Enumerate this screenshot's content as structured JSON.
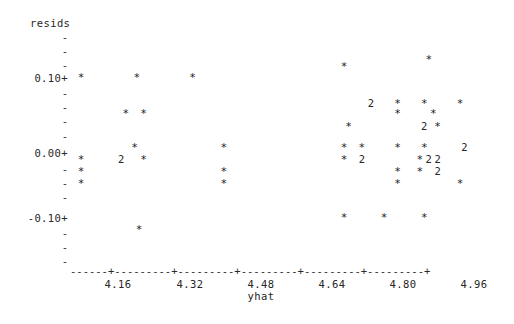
{
  "chart_data": {
    "type": "scatter",
    "title": "",
    "subtitle": "",
    "ylabel": "resids",
    "xlabel": "yhat",
    "style": "character-grid-ascii-scatter",
    "grid": false,
    "legend": null,
    "point_glyph": "*",
    "overlap_glyph_note": "digit shows number of overlapping points at that cell",
    "xlim": [
      4.08,
      5.0
    ],
    "ylim": [
      -0.155,
      0.155
    ],
    "x_ticks": [
      "4.16",
      "4.32",
      "4.48",
      "4.64",
      "4.80",
      "4.96"
    ],
    "x_tick_values": [
      4.16,
      4.32,
      4.48,
      4.64,
      4.8,
      4.96
    ],
    "y_ticks": [
      "0.10+",
      "0.00+",
      "-0.10+"
    ],
    "y_tick_values": [
      0.1,
      0.0,
      -0.1
    ],
    "y_minor_tick_glyph": "-",
    "axis_line": "------+---------+---------+---------+---------+---------+",
    "points": [
      {
        "x": 4.105,
        "y": 0.1,
        "glyph": "*",
        "count": 1
      },
      {
        "x": 4.23,
        "y": 0.1,
        "glyph": "*",
        "count": 1
      },
      {
        "x": 4.355,
        "y": 0.1,
        "glyph": "*",
        "count": 1
      },
      {
        "x": 4.695,
        "y": 0.115,
        "glyph": "*",
        "count": 1
      },
      {
        "x": 4.885,
        "y": 0.125,
        "glyph": "*",
        "count": 1
      },
      {
        "x": 4.755,
        "y": 0.062,
        "glyph": "2",
        "count": 2
      },
      {
        "x": 4.815,
        "y": 0.062,
        "glyph": "*",
        "count": 1
      },
      {
        "x": 4.875,
        "y": 0.062,
        "glyph": "*",
        "count": 1
      },
      {
        "x": 4.955,
        "y": 0.062,
        "glyph": "*",
        "count": 1
      },
      {
        "x": 4.205,
        "y": 0.048,
        "glyph": "*",
        "count": 1
      },
      {
        "x": 4.245,
        "y": 0.048,
        "glyph": "*",
        "count": 1
      },
      {
        "x": 4.815,
        "y": 0.048,
        "glyph": "*",
        "count": 1
      },
      {
        "x": 4.895,
        "y": 0.048,
        "glyph": "*",
        "count": 1
      },
      {
        "x": 4.705,
        "y": 0.03,
        "glyph": "*",
        "count": 1
      },
      {
        "x": 4.875,
        "y": 0.03,
        "glyph": "2",
        "count": 2
      },
      {
        "x": 4.905,
        "y": 0.03,
        "glyph": "*",
        "count": 1
      },
      {
        "x": 4.225,
        "y": 0.0,
        "glyph": "*",
        "count": 1
      },
      {
        "x": 4.425,
        "y": 0.0,
        "glyph": "*",
        "count": 1
      },
      {
        "x": 4.695,
        "y": 0.0,
        "glyph": "*",
        "count": 1
      },
      {
        "x": 4.735,
        "y": 0.0,
        "glyph": "*",
        "count": 1
      },
      {
        "x": 4.815,
        "y": 0.0,
        "glyph": "*",
        "count": 1
      },
      {
        "x": 4.875,
        "y": 0.0,
        "glyph": "*",
        "count": 1
      },
      {
        "x": 4.965,
        "y": 0.0,
        "glyph": "2",
        "count": 2
      },
      {
        "x": 4.105,
        "y": -0.018,
        "glyph": "*",
        "count": 1
      },
      {
        "x": 4.195,
        "y": -0.018,
        "glyph": "2",
        "count": 2
      },
      {
        "x": 4.245,
        "y": -0.018,
        "glyph": "*",
        "count": 1
      },
      {
        "x": 4.695,
        "y": -0.018,
        "glyph": "*",
        "count": 1
      },
      {
        "x": 4.735,
        "y": -0.018,
        "glyph": "2",
        "count": 2
      },
      {
        "x": 4.865,
        "y": -0.018,
        "glyph": "*",
        "count": 1
      },
      {
        "x": 4.885,
        "y": -0.018,
        "glyph": "2",
        "count": 2
      },
      {
        "x": 4.905,
        "y": -0.018,
        "glyph": "2",
        "count": 2
      },
      {
        "x": 4.105,
        "y": -0.035,
        "glyph": "*",
        "count": 1
      },
      {
        "x": 4.425,
        "y": -0.035,
        "glyph": "*",
        "count": 1
      },
      {
        "x": 4.815,
        "y": -0.035,
        "glyph": "*",
        "count": 1
      },
      {
        "x": 4.865,
        "y": -0.035,
        "glyph": "*",
        "count": 1
      },
      {
        "x": 4.905,
        "y": -0.035,
        "glyph": "2",
        "count": 2
      },
      {
        "x": 4.105,
        "y": -0.052,
        "glyph": "*",
        "count": 1
      },
      {
        "x": 4.425,
        "y": -0.052,
        "glyph": "*",
        "count": 1
      },
      {
        "x": 4.815,
        "y": -0.052,
        "glyph": "*",
        "count": 1
      },
      {
        "x": 4.955,
        "y": -0.052,
        "glyph": "*",
        "count": 1
      },
      {
        "x": 4.695,
        "y": -0.1,
        "glyph": "*",
        "count": 1
      },
      {
        "x": 4.785,
        "y": -0.1,
        "glyph": "*",
        "count": 1
      },
      {
        "x": 4.875,
        "y": -0.1,
        "glyph": "*",
        "count": 1
      },
      {
        "x": 4.235,
        "y": -0.118,
        "glyph": "*",
        "count": 1
      }
    ]
  },
  "layout": {
    "plot_left_px": 70,
    "plot_right_px": 480,
    "axis_y_px": 271,
    "row_height_px": 14.2,
    "x_per_px": 0.0022535,
    "tick_px": [
      118,
      190,
      261,
      332,
      403,
      474
    ]
  },
  "rows": {
    "y_axis_rows": [
      {
        "label": "",
        "glyph": "-",
        "major": false,
        "top": 32
      },
      {
        "label": "",
        "glyph": "-",
        "major": false,
        "top": 46
      },
      {
        "label": "",
        "glyph": "-",
        "major": false,
        "top": 60
      },
      {
        "label": "0.10+",
        "glyph": "",
        "major": true,
        "top": 73
      },
      {
        "label": "",
        "glyph": "-",
        "major": false,
        "top": 88
      },
      {
        "label": "",
        "glyph": "-",
        "major": false,
        "top": 102
      },
      {
        "label": "",
        "glyph": "-",
        "major": false,
        "top": 116
      },
      {
        "label": "",
        "glyph": "-",
        "major": false,
        "top": 131
      },
      {
        "label": "0.00+",
        "glyph": "",
        "major": true,
        "top": 148
      },
      {
        "label": "",
        "glyph": "-",
        "major": false,
        "top": 164
      },
      {
        "label": "",
        "glyph": "-",
        "major": false,
        "top": 178
      },
      {
        "label": "",
        "glyph": "-",
        "major": false,
        "top": 192
      },
      {
        "label": "-0.10+",
        "glyph": "",
        "major": true,
        "top": 213
      },
      {
        "label": "",
        "glyph": "-",
        "major": false,
        "top": 228
      },
      {
        "label": "",
        "glyph": "-",
        "major": false,
        "top": 242
      },
      {
        "label": "",
        "glyph": "-",
        "major": false,
        "top": 256
      }
    ]
  },
  "colors": {
    "background": "#ffffff",
    "text": "#262626",
    "marker": "#1c1c1c"
  }
}
